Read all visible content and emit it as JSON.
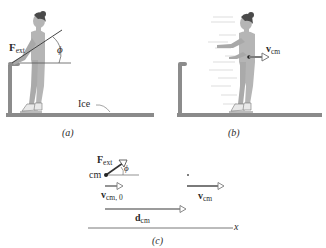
{
  "panels": {
    "a": {
      "caption": "(a)",
      "force_label": "F",
      "force_sub": "ext",
      "angle_label": "ϕ",
      "ice_label": "Ice"
    },
    "b": {
      "caption": "(b)",
      "velocity_label": "v",
      "velocity_sub": "cm"
    },
    "c": {
      "caption": "(c)",
      "force_label": "F",
      "force_sub": "ext",
      "angle_label": "ϕ",
      "cm_label": "cm",
      "v0_label": "v",
      "v0_sub": "cm, 0",
      "v_label": "v",
      "v_sub": "cm",
      "d_label": "d",
      "d_sub": "cm",
      "axis_label": "x",
      "marker": "•"
    }
  },
  "colors": {
    "ground": "#8a8a8a",
    "rail": "#8c8c8c",
    "skater_body": "#b5b5b5",
    "skater_hair": "#4a4a4a",
    "arrow": "#7a7a7a",
    "line": "#555555"
  }
}
